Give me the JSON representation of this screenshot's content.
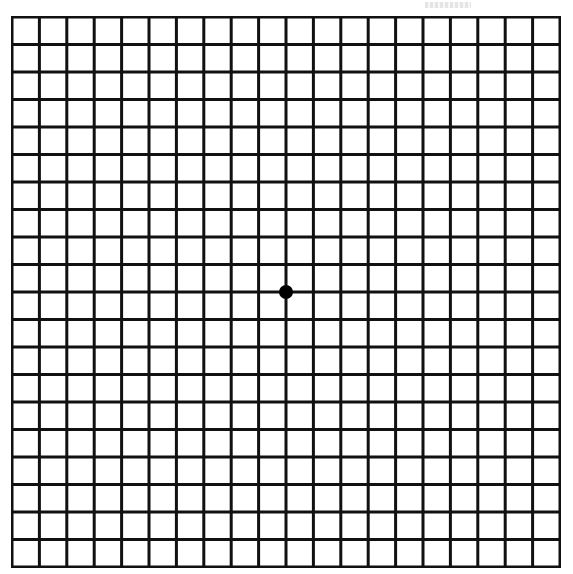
{
  "diagram": {
    "type": "amsler-grid",
    "rows": 20,
    "columns": 20,
    "line_color": "#111111",
    "line_width": 3,
    "background": "#ffffff",
    "fixation_dot": {
      "color": "#000000",
      "radius": 7,
      "row_intersection": 10,
      "column_intersection": 10
    },
    "grid_bounds": {
      "left": 12,
      "top": 17,
      "right": 560,
      "bottom": 567
    }
  }
}
